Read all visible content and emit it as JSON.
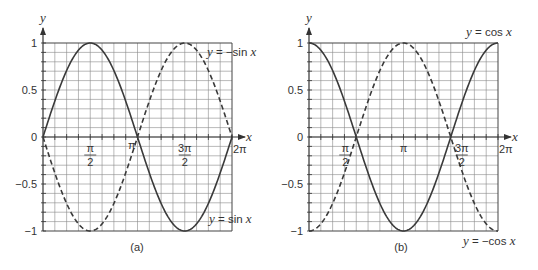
{
  "chart_data": [
    {
      "id": "a",
      "type": "line",
      "caption": "(a)",
      "xlabel": "x",
      "ylabel": "y",
      "xlim": [
        0,
        6.283185307179586
      ],
      "ylim": [
        -1,
        1
      ],
      "grid": true,
      "grid_x_divisions": 16,
      "grid_y_divisions": 20,
      "x_ticks": [
        {
          "value": 1.5707963267948966,
          "label_num": "π",
          "label_den": "2"
        },
        {
          "value": 3.141592653589793,
          "label": "π"
        },
        {
          "value": 4.71238898038469,
          "label_num": "3π",
          "label_den": "2"
        },
        {
          "value": 6.283185307179586,
          "label": "2π"
        }
      ],
      "y_ticks": [
        {
          "value": 1,
          "label": "1"
        },
        {
          "value": 0.5,
          "label": "0.5"
        },
        {
          "value": 0,
          "label": "0"
        },
        {
          "value": -0.5,
          "label": "−0.5"
        },
        {
          "value": -1,
          "label": "−1"
        }
      ],
      "series": [
        {
          "name": "y = sin x",
          "function": "sin",
          "style": "solid",
          "x": [
            0,
            0.785,
            1.571,
            2.356,
            3.142,
            3.927,
            4.712,
            5.498,
            6.283
          ],
          "values": [
            0,
            0.707,
            1,
            0.707,
            0,
            -0.707,
            -1,
            -0.707,
            0
          ]
        },
        {
          "name": "y = −sin x",
          "function": "neg_sin",
          "style": "dashed",
          "x": [
            0,
            0.785,
            1.571,
            2.356,
            3.142,
            3.927,
            4.712,
            5.498,
            6.283
          ],
          "values": [
            0,
            -0.707,
            -1,
            -0.707,
            0,
            0.707,
            1,
            0.707,
            0
          ]
        }
      ],
      "annotations": [
        {
          "text_pre": "y",
          "text_post": " = −sin ",
          "text_var": "x",
          "near": "top-right"
        },
        {
          "text_pre": "y",
          "text_post": " = sin ",
          "text_var": "x",
          "near": "bottom-right"
        }
      ]
    },
    {
      "id": "b",
      "type": "line",
      "caption": "(b)",
      "xlabel": "x",
      "ylabel": "y",
      "xlim": [
        0,
        6.283185307179586
      ],
      "ylim": [
        -1,
        1
      ],
      "grid": true,
      "grid_x_divisions": 16,
      "grid_y_divisions": 20,
      "x_ticks": [
        {
          "value": 1.5707963267948966,
          "label_num": "π",
          "label_den": "2"
        },
        {
          "value": 3.141592653589793,
          "label": "π"
        },
        {
          "value": 4.71238898038469,
          "label_num": "3π",
          "label_den": "2"
        },
        {
          "value": 6.283185307179586,
          "label": "2π"
        }
      ],
      "y_ticks": [
        {
          "value": 1,
          "label": "1"
        },
        {
          "value": 0.5,
          "label": "0.5"
        },
        {
          "value": 0,
          "label": "0"
        },
        {
          "value": -0.5,
          "label": "−0.5"
        },
        {
          "value": -1,
          "label": "−1"
        }
      ],
      "series": [
        {
          "name": "y = cos x",
          "function": "cos",
          "style": "solid",
          "x": [
            0,
            0.785,
            1.571,
            2.356,
            3.142,
            3.927,
            4.712,
            5.498,
            6.283
          ],
          "values": [
            1,
            0.707,
            0,
            -0.707,
            -1,
            -0.707,
            0,
            0.707,
            1
          ]
        },
        {
          "name": "y = −cos x",
          "function": "neg_cos",
          "style": "dashed",
          "x": [
            0,
            0.785,
            1.571,
            2.356,
            3.142,
            3.927,
            4.712,
            5.498,
            6.283
          ],
          "values": [
            -1,
            -0.707,
            0,
            0.707,
            1,
            0.707,
            0,
            -0.707,
            -1
          ]
        }
      ],
      "annotations": [
        {
          "text_pre": "y",
          "text_post": " = cos ",
          "text_var": "x",
          "near": "top-right"
        },
        {
          "text_pre": "y",
          "text_post": " = −cos ",
          "text_var": "x",
          "near": "bottom-right"
        }
      ]
    }
  ],
  "colors": {
    "curve": "#3a3a3a",
    "grid": "#8a8a8a",
    "axis": "#333333",
    "frame": "#444444"
  }
}
